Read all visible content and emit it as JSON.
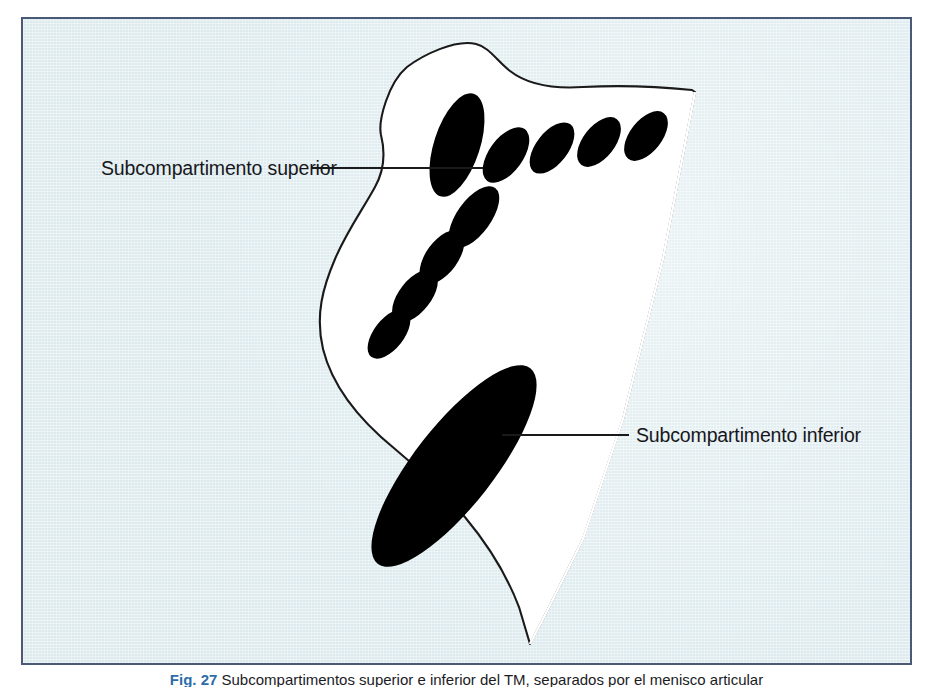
{
  "figure": {
    "type": "anatomical-line-diagram",
    "panel": {
      "background_color": "#dceaee",
      "border_color": "#4a5a76",
      "shape_fill": "#ffffff",
      "shape_outline_color": "#1a1a1a",
      "feature_fill": "#000000"
    },
    "callouts": [
      {
        "id": "superior",
        "label": "Subcompartimento superior",
        "leader_line": true
      },
      {
        "id": "inferior",
        "label": "Subcompartimento inferior",
        "leader_line": true
      }
    ],
    "caption": {
      "figure_number": "Fig. 27",
      "text": "Subcompartimentos superior e inferior del TM, separados por el menisco articular"
    }
  }
}
